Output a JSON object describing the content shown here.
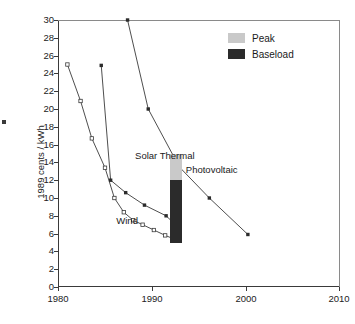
{
  "chart_data": {
    "type": "line",
    "title": "",
    "xlabel": "",
    "ylabel": "1989 cents / kWh",
    "xlim": [
      1980,
      2010
    ],
    "ylim": [
      0,
      30
    ],
    "xticks": [
      1980,
      1990,
      2000,
      2010
    ],
    "yticks": [
      0,
      2,
      4,
      6,
      8,
      10,
      12,
      14,
      16,
      18,
      20,
      22,
      24,
      26,
      28,
      30
    ],
    "grid": false,
    "legend_position": "top-right",
    "series": [
      {
        "name": "Wind",
        "marker": "open-square",
        "x": [
          1981,
          1982.4,
          1983.6,
          1985,
          1986,
          1987,
          1988,
          1989,
          1990.2,
          1991.4,
          1992.8
        ],
        "y": [
          25.0,
          20.9,
          16.7,
          13.4,
          10.0,
          8.4,
          7.5,
          7.0,
          6.4,
          5.8,
          5.2
        ]
      },
      {
        "name": "Solar Thermal",
        "marker": "filled-square",
        "x": [
          1984.6,
          1985.6,
          1987.2,
          1989.2,
          1991.5,
          1992.9
        ],
        "y": [
          24.9,
          12.0,
          10.6,
          9.2,
          8.0,
          6.6
        ]
      },
      {
        "name": "Photovoltaic",
        "marker": "filled-square",
        "x": [
          1987.4,
          1989.6,
          1992.9,
          1996.1,
          2000.2
        ],
        "y": [
          30.0,
          20.0,
          13.5,
          10.0,
          5.9
        ]
      }
    ],
    "bar": {
      "x": 1992.6,
      "segments": [
        {
          "name": "Peak",
          "from": 12.0,
          "to": 15.0,
          "color": "#c9c9c9"
        },
        {
          "name": "Baseload",
          "from": 4.9,
          "to": 12.0,
          "color": "#2b2b2b"
        }
      ]
    },
    "annotations": [
      {
        "text": "Solar Thermal",
        "x": 1988.2,
        "y": 14.7
      },
      {
        "text": "Wind",
        "x": 1986.2,
        "y": 7.4
      },
      {
        "text": "Photovoltaic",
        "x": 1993.6,
        "y": 13.1
      }
    ],
    "legend": [
      {
        "label": "Peak",
        "color": "#c9c9c9"
      },
      {
        "label": "Baseload",
        "color": "#2b2b2b"
      }
    ]
  }
}
